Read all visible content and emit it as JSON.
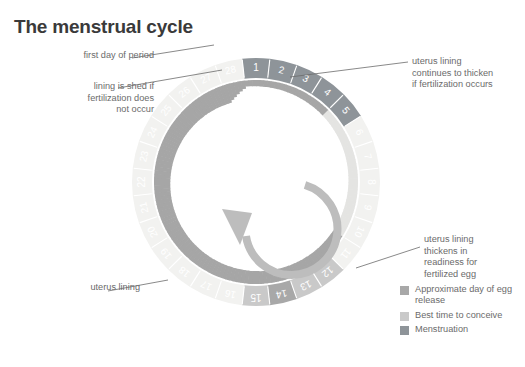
{
  "title": "The menstrual cycle",
  "callouts": {
    "first_day": "first day of period",
    "lining_shed": "lining is shed if\nfertilization does\nnot occur",
    "thicken_occurs": "uterus lining\ncontinues to thicken\nif fertilization occurs",
    "thicken_ready": "uterus lining\nthickens in\nreadiness for\nfertilized egg",
    "uterus_lining": "uterus lining"
  },
  "legend": {
    "items": [
      {
        "label": "Approximate day of\negg release",
        "color": "#a8a8a8"
      },
      {
        "label": "Best time to conceive",
        "color": "#c9c9c9"
      },
      {
        "label": "Menstruation",
        "color": "#8e9499"
      }
    ]
  },
  "colors": {
    "menstruation": "#8e9499",
    "egg_release": "#a8a8a8",
    "conceive": "#c9c9c9",
    "plain_day": "#f2f2f0",
    "lining_dark": "#a6a6a6",
    "lining_light": "#e4e4e2",
    "arrow": "#b5b5b5",
    "tick": "#ffffff",
    "day_number": "#ffffff",
    "leader_line": "#6b6b6b",
    "title": "#3a3a3a",
    "text": "#6b6b6b"
  },
  "chart_data": {
    "type": "pie",
    "title": "The menstrual cycle",
    "legend_position": "bottom-right",
    "grid": false,
    "categories": [
      1,
      2,
      3,
      4,
      5,
      6,
      7,
      8,
      9,
      10,
      11,
      12,
      13,
      14,
      15,
      16,
      17,
      18,
      19,
      20,
      21,
      22,
      23,
      24,
      25,
      26,
      27,
      28
    ],
    "values": [
      1,
      1,
      1,
      1,
      1,
      1,
      1,
      1,
      1,
      1,
      1,
      1,
      1,
      1,
      1,
      1,
      1,
      1,
      1,
      1,
      1,
      1,
      1,
      1,
      1,
      1,
      1,
      1
    ],
    "day_labels": [
      "1",
      "2",
      "3",
      "4",
      "5",
      "6",
      "7",
      "8",
      "9",
      "10",
      "11",
      "12",
      "13",
      "14",
      "15",
      "16",
      "17",
      "18",
      "19",
      "20",
      "21",
      "22",
      "23",
      "24",
      "25",
      "26",
      "27",
      "28"
    ],
    "phases": [
      {
        "name": "Menstruation",
        "days": [
          1,
          2,
          3,
          4,
          5
        ],
        "color": "#8e9499"
      },
      {
        "name": "Best time to conceive",
        "days": [
          12,
          13,
          15
        ],
        "color": "#c9c9c9"
      },
      {
        "name": "Approximate day of egg release",
        "days": [
          14
        ],
        "color": "#a8a8a8"
      },
      {
        "name": "Other days",
        "days": [
          6,
          7,
          8,
          9,
          10,
          11,
          16,
          17,
          18,
          19,
          20,
          21,
          22,
          23,
          24,
          25,
          26,
          27,
          28
        ],
        "color": "#f2f2f0"
      }
    ],
    "lining_thickness": {
      "description": "Inner spiral band representing uterus lining thickness over the cycle",
      "min_day": 1,
      "max_day": 28,
      "values": [
        2,
        3,
        4,
        5,
        6,
        7,
        8,
        9,
        10,
        11,
        12,
        13,
        14,
        15,
        16,
        17,
        18,
        19,
        20,
        21,
        22,
        23,
        24,
        25,
        26,
        27,
        28,
        29
      ]
    },
    "rotation_direction": "counter-clockwise",
    "total_days": 28
  }
}
